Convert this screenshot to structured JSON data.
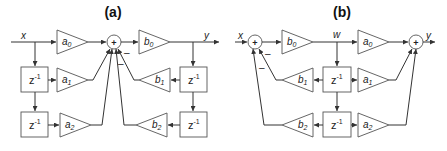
{
  "diagrams": {
    "a": {
      "title": "(a)",
      "input_label": "x",
      "output_label": "y",
      "sum_symbol": "+",
      "minus_sign": "–",
      "z_base": "z",
      "z_exp": "-1",
      "gains": {
        "a0": {
          "base": "a",
          "sub": "0"
        },
        "a1": {
          "base": "a",
          "sub": "1"
        },
        "a2": {
          "base": "a",
          "sub": "2"
        },
        "b0": {
          "base": "b",
          "sub": "0"
        },
        "b1": {
          "base": "b",
          "sub": "1"
        },
        "b2": {
          "base": "b",
          "sub": "2"
        }
      }
    },
    "b": {
      "title": "(b)",
      "input_label": "x",
      "output_label": "y",
      "internal_label": "w",
      "sum_symbol": "+",
      "minus_sign": "–",
      "z_base": "z",
      "z_exp": "-1",
      "gains": {
        "a0": {
          "base": "a",
          "sub": "0"
        },
        "a1": {
          "base": "a",
          "sub": "1"
        },
        "a2": {
          "base": "a",
          "sub": "2"
        },
        "b0": {
          "base": "b",
          "sub": "0"
        },
        "b1": {
          "base": "b",
          "sub": "1"
        },
        "b2": {
          "base": "b",
          "sub": "2"
        }
      }
    }
  }
}
